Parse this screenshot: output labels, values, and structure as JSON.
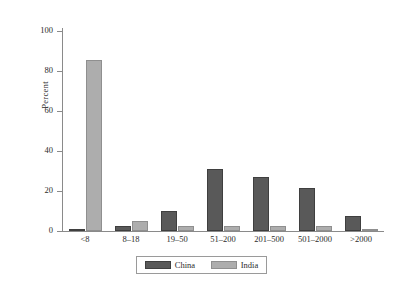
{
  "chart_data": {
    "type": "bar",
    "title": "",
    "xlabel": "",
    "ylabel": "Percent",
    "ylim": [
      0,
      100
    ],
    "yticks": [
      0,
      20,
      40,
      60,
      80,
      100
    ],
    "ytick_labels": [
      "0",
      "20",
      "40",
      "60",
      "80",
      "100"
    ],
    "grid": false,
    "legend_position": "bottom-center",
    "categories": [
      "<8",
      "8–18",
      "19–50",
      "51–200",
      "201–500",
      "501–2000",
      ">2000"
    ],
    "series": [
      {
        "name": "China",
        "color": "#595959",
        "values": [
          1.0,
          2.5,
          10.0,
          31.0,
          27.0,
          21.5,
          7.5
        ]
      },
      {
        "name": "India",
        "color": "#adadad",
        "values": [
          85.5,
          5.0,
          2.5,
          2.5,
          2.5,
          2.5,
          1.0
        ]
      }
    ]
  },
  "legend": {
    "entries": [
      {
        "label": "China",
        "swatch": "china-swatch"
      },
      {
        "label": "India",
        "swatch": "india-swatch"
      }
    ]
  },
  "axis": {
    "y_label": "Percent"
  }
}
